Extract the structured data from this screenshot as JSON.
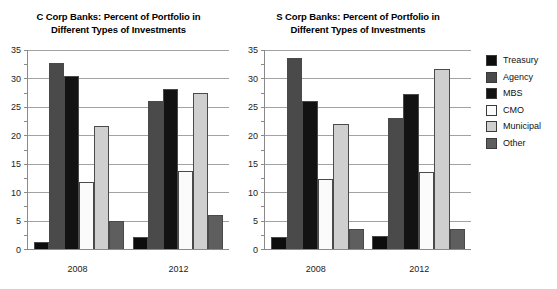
{
  "chart_data": [
    {
      "type": "bar",
      "title": "C Corp Banks: Percent of Portfolio in Different Types of Investments",
      "title_line1": "C Corp Banks: Percent of Portfolio in",
      "title_line2": "Different Types of Investments",
      "xlabel": "",
      "ylabel": "",
      "ylim": [
        0,
        35
      ],
      "yticks": [
        0,
        5,
        10,
        15,
        20,
        25,
        30,
        35
      ],
      "ytick_labels": [
        "0",
        "5",
        "10",
        "15",
        "20",
        "25",
        "30",
        "35"
      ],
      "minor_gridlines": true,
      "grid": true,
      "legend_position": "right",
      "categories": [
        "2008",
        "2012"
      ],
      "series": [
        {
          "name": "Treasury",
          "color": "#0d0d0d",
          "values": [
            1.2,
            2.2
          ]
        },
        {
          "name": "Agency",
          "color": "#4a4a4a",
          "values": [
            32.8,
            26.0
          ]
        },
        {
          "name": "MBS",
          "color": "#121212",
          "values": [
            30.4,
            28.2
          ]
        },
        {
          "name": "CMO",
          "color": "#fbfbfb",
          "values": [
            11.8,
            13.7
          ]
        },
        {
          "name": "Municipal",
          "color": "#cfcfcf",
          "values": [
            21.6,
            27.5
          ]
        },
        {
          "name": "Other",
          "color": "#5e5e5e",
          "values": [
            5.0,
            6.0
          ]
        }
      ]
    },
    {
      "type": "bar",
      "title": "S Corp Banks: Percent of Portfolio in Different Types of Investments",
      "title_line1": "S Corp Banks: Percent of Portfolio in",
      "title_line2": "Different Types of Investments",
      "xlabel": "",
      "ylabel": "",
      "ylim": [
        0,
        35
      ],
      "yticks": [
        0,
        5,
        10,
        15,
        20,
        25,
        30,
        35
      ],
      "ytick_labels": [
        "0",
        "5",
        "10",
        "15",
        "20",
        "25",
        "30",
        "35"
      ],
      "minor_gridlines": true,
      "grid": true,
      "legend_position": "right",
      "categories": [
        "2008",
        "2012"
      ],
      "series": [
        {
          "name": "Treasury",
          "color": "#0d0d0d",
          "values": [
            2.2,
            2.3
          ]
        },
        {
          "name": "Agency",
          "color": "#4a4a4a",
          "values": [
            33.6,
            23.1
          ]
        },
        {
          "name": "MBS",
          "color": "#121212",
          "values": [
            26.1,
            27.3
          ]
        },
        {
          "name": "CMO",
          "color": "#fbfbfb",
          "values": [
            12.3,
            13.5
          ]
        },
        {
          "name": "Municipal",
          "color": "#cfcfcf",
          "values": [
            21.9,
            31.6
          ]
        },
        {
          "name": "Other",
          "color": "#5e5e5e",
          "values": [
            3.6,
            3.5
          ]
        }
      ]
    }
  ],
  "legend": {
    "items": [
      {
        "label": "Treasury",
        "color": "#0d0d0d"
      },
      {
        "label": "Agency",
        "color": "#4a4a4a"
      },
      {
        "label": "MBS",
        "color": "#121212"
      },
      {
        "label": "CMO",
        "color": "#fbfbfb"
      },
      {
        "label": "Municipal",
        "color": "#cfcfcf"
      },
      {
        "label": "Other",
        "color": "#5e5e5e"
      }
    ]
  }
}
